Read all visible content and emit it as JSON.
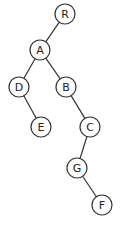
{
  "diagram": {
    "type": "binary-tree",
    "node_radius": 10,
    "nodes": [
      {
        "id": "R",
        "label": "R",
        "x": 65,
        "y": 14
      },
      {
        "id": "A",
        "label": "A",
        "x": 40,
        "y": 50
      },
      {
        "id": "D",
        "label": "D",
        "x": 19,
        "y": 87
      },
      {
        "id": "B",
        "label": "B",
        "x": 66,
        "y": 87
      },
      {
        "id": "E",
        "label": "E",
        "x": 41,
        "y": 127
      },
      {
        "id": "C",
        "label": "C",
        "x": 90,
        "y": 127
      },
      {
        "id": "G",
        "label": "G",
        "x": 77,
        "y": 168
      },
      {
        "id": "F",
        "label": "F",
        "x": 102,
        "y": 205
      }
    ],
    "edges": [
      {
        "from": "R",
        "to": "A"
      },
      {
        "from": "A",
        "to": "D"
      },
      {
        "from": "A",
        "to": "B"
      },
      {
        "from": "D",
        "to": "E"
      },
      {
        "from": "B",
        "to": "C"
      },
      {
        "from": "C",
        "to": "G"
      },
      {
        "from": "G",
        "to": "F"
      }
    ]
  }
}
